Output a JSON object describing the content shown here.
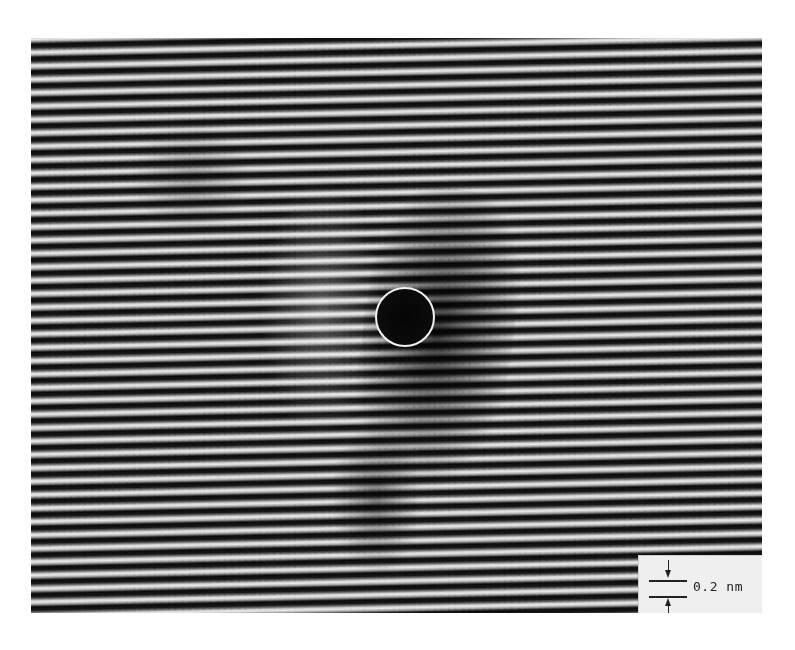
{
  "image": {
    "type": "HRTEM lattice fringe micrograph",
    "description": "Horizontal lattice fringes with a local distortion; a white circle marks the center of the defect",
    "fringe_orientation": "horizontal",
    "colors": {
      "background": "#ffffff",
      "fringe_dark": "#101010",
      "fringe_light": "#e2e2e2",
      "marker": "#f2f2f2"
    }
  },
  "marker": {
    "shape": "circle",
    "label": ""
  },
  "scale_bar": {
    "label": "0.2 nm",
    "value": 0.2,
    "unit": "nm"
  }
}
